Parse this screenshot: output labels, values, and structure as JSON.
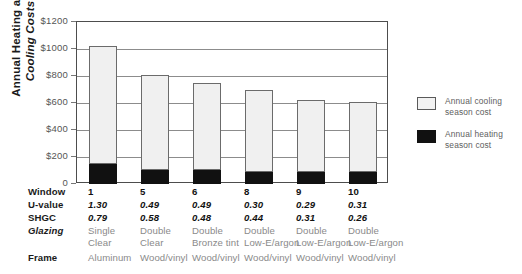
{
  "chart_data": {
    "type": "bar",
    "title": "",
    "subtitle": "",
    "stacked": true,
    "xlabel": "",
    "ylabel": "Annual Heating and Cooling Costs",
    "ylabel_line1": "Annual Heating and",
    "ylabel_line2": "Cooling Costs",
    "ylim": [
      0,
      1200
    ],
    "yticks": [
      0,
      200,
      400,
      600,
      800,
      1000,
      1200
    ],
    "ytick_labels": [
      "0",
      "$200",
      "$400",
      "$600",
      "$800",
      "$1000",
      "$1200"
    ],
    "grid": true,
    "grid_axis": "y",
    "legend_position": "right",
    "categories": [
      "1",
      "5",
      "6",
      "8",
      "9",
      "10"
    ],
    "series": [
      {
        "name": "Annual heating season cost",
        "color": "#111111",
        "values": [
          145,
          105,
          103,
          90,
          90,
          90
        ]
      },
      {
        "name": "Annual cooling season cost",
        "color": "#f0f0f0",
        "values": [
          875,
          705,
          642,
          605,
          535,
          518
        ]
      }
    ],
    "totals": [
      1020,
      810,
      745,
      695,
      625,
      608
    ]
  },
  "legend": {
    "items": [
      {
        "swatch": "cool",
        "line1": "Annual cooling",
        "line2": "season cost"
      },
      {
        "swatch": "heat",
        "line1": "Annual heating",
        "line2": "season cost"
      }
    ]
  },
  "table": {
    "row_labels": [
      "Window",
      "U-value",
      "SHGC",
      "Glazing",
      "Frame"
    ],
    "columns": [
      {
        "window": "1",
        "u_value": "1.30",
        "shgc": "0.79",
        "glazing_line1": "Single",
        "glazing_line2": "Clear",
        "frame": "Aluminum"
      },
      {
        "window": "5",
        "u_value": "0.49",
        "shgc": "0.58",
        "glazing_line1": "Double",
        "glazing_line2": "Clear",
        "frame": "Wood/vinyl"
      },
      {
        "window": "6",
        "u_value": "0.49",
        "shgc": "0.48",
        "glazing_line1": "Double",
        "glazing_line2": "Bronze tint",
        "frame": "Wood/vinyl"
      },
      {
        "window": "8",
        "u_value": "0.30",
        "shgc": "0.44",
        "glazing_line1": "Double",
        "glazing_line2": "Low-E/argon",
        "frame": "Wood/vinyl"
      },
      {
        "window": "9",
        "u_value": "0.29",
        "shgc": "0.31",
        "glazing_line1": "Double",
        "glazing_line2": "Low-E/argon",
        "frame": "Wood/vinyl"
      },
      {
        "window": "10",
        "u_value": "0.31",
        "shgc": "0.26",
        "glazing_line1": "Double",
        "glazing_line2": "Low-E/argon",
        "frame": "Wood/vinyl"
      }
    ]
  },
  "colors": {
    "cooling": "#f0f0f0",
    "heating": "#111111",
    "grid": "#8c8c8c",
    "axis": "#4d4d4d",
    "muted_text": "#8a8a8a"
  }
}
